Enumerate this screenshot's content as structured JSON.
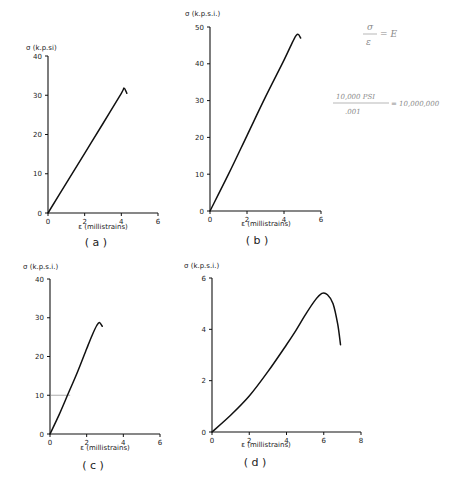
{
  "chart_data": [
    {
      "id": "a",
      "type": "line",
      "panel_label": "( a )",
      "ylabel": "σ (k.p.si)",
      "xlabel": "ε (millistrains)",
      "xlim": [
        0,
        6
      ],
      "ylim": [
        0,
        40
      ],
      "xticks": [
        "0",
        "2",
        "4",
        "6"
      ],
      "yticks": [
        "0",
        "10",
        "20",
        "30",
        "40"
      ],
      "grid": false,
      "series": [
        {
          "name": "a",
          "x": [
            0,
            1,
            2,
            3,
            4.0,
            4.15,
            4.3
          ],
          "y": [
            0,
            7.6,
            15.2,
            22.8,
            30.5,
            31.8,
            30.5
          ]
        }
      ]
    },
    {
      "id": "b",
      "type": "line",
      "panel_label": "( b )",
      "ylabel": "σ (k.p.s.i.)",
      "xlabel": "ε (millistrains)",
      "xlim": [
        0,
        6
      ],
      "ylim": [
        0,
        50
      ],
      "xticks": [
        "0",
        "2",
        "4",
        "6"
      ],
      "yticks": [
        "0",
        "10",
        "20",
        "30",
        "40",
        "50"
      ],
      "grid": false,
      "series": [
        {
          "name": "b",
          "x": [
            0,
            1,
            2,
            3,
            4,
            4.55,
            4.75,
            4.9
          ],
          "y": [
            0,
            10,
            20.5,
            31,
            41,
            46.8,
            48,
            47
          ]
        }
      ]
    },
    {
      "id": "c",
      "type": "line",
      "panel_label": "( c )",
      "ylabel": "σ (k.p.s.i.)",
      "xlabel": "ε (millistrains)",
      "xlim": [
        0,
        6
      ],
      "ylim": [
        0,
        40
      ],
      "xticks": [
        "0",
        "2",
        "4",
        "6"
      ],
      "yticks": [
        "0",
        "10",
        "20",
        "30",
        "40"
      ],
      "grid": false,
      "annotation": {
        "type": "hline",
        "y": 10,
        "x_from": 0,
        "x_to": 1.1
      },
      "series": [
        {
          "name": "c",
          "x": [
            0,
            0.5,
            1,
            1.5,
            2,
            2.3,
            2.55,
            2.7,
            2.85
          ],
          "y": [
            0,
            5,
            10.5,
            16,
            22,
            25.5,
            28,
            28.8,
            27.8
          ]
        }
      ]
    },
    {
      "id": "d",
      "type": "line",
      "panel_label": "( d )",
      "ylabel": "σ (k.p.s.i.)",
      "xlabel": "ε (millistrains)",
      "xlim": [
        0,
        8
      ],
      "ylim": [
        0,
        6
      ],
      "xticks": [
        "0",
        "2",
        "4",
        "6",
        "8"
      ],
      "yticks": [
        "0",
        "2",
        "4",
        "6"
      ],
      "grid": false,
      "series": [
        {
          "name": "d",
          "x": [
            0,
            1,
            2,
            3,
            4,
            4.5,
            5,
            5.5,
            5.9,
            6.2,
            6.5,
            6.75,
            6.9
          ],
          "y": [
            0,
            0.65,
            1.4,
            2.35,
            3.4,
            3.95,
            4.55,
            5.1,
            5.4,
            5.35,
            5.0,
            4.2,
            3.4
          ]
        }
      ]
    }
  ],
  "handwritten_notes": {
    "formula_top": {
      "numerator": "σ",
      "denominator": "ε",
      "rhs": "= E"
    },
    "formula_bottom": {
      "numerator": "10,000 PSI",
      "denominator": ".001",
      "rhs": "= 10,000,000"
    }
  }
}
